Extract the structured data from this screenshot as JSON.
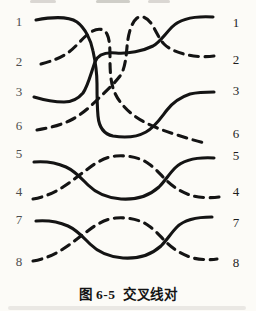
{
  "figure": {
    "caption": "图 6-5  交叉线对",
    "caption_number": "图 6-5",
    "caption_title": "交叉线对",
    "type": "wiring-diagram",
    "description_visible_content": "Eight wires drawn between identical pin columns; pairs 1/2 and 3/6 cross over each other, pairs 5/4 and 7/8 are simple twisted pairs"
  },
  "labels": {
    "left": [
      "1",
      "2",
      "3",
      "6",
      "5",
      "4",
      "7",
      "8"
    ],
    "right": [
      "1",
      "2",
      "3",
      "6",
      "5",
      "4",
      "7",
      "8"
    ]
  },
  "colors": {
    "background": "#fcfbf7",
    "line": "#141414",
    "label_left": "#4e4e4e",
    "label_right": "#1d1d1d"
  },
  "wires": [
    {
      "name": "wire-left1-to-right3",
      "from": "1",
      "to": "3",
      "style": "solid",
      "path": "M 36 20 C 52 17 68 16 77 22 C 85 28 91 40 93 51 C 95 60 97 70 97 84 C 97 95 97 105 98 116 C 99 127 103 134 113 136 C 125 138 137 137 146 132 C 155 127 160 119 167 110 C 174 101 181 97 190 94 C 199 92 207 92 214 92"
    },
    {
      "name": "wire-left3-to-right1",
      "from": "3",
      "to": "1",
      "style": "solid",
      "path": "M 34 97 C 44 100 54 102 64 102 C 72 102 78 99 83 93 C 88 86 91 73 95 62 C 98 54 106 52 116 53 C 128 54 143 51 153 46 C 160 42 165 34 172 27 C 180 19 196 16 213 17"
    },
    {
      "name": "wire-left2-to-right6",
      "from": "2",
      "to": "6",
      "style": "dashed",
      "path": "M 41 64 C 52 61 61 58 69 52 C 77 46 83 37 91 32 C 97 28 104 28 107 34 C 110 40 110 50 110 60 C 110 73 111 83 114 91 C 118 101 126 110 136 117 C 146 124 159 129 171 133 C 183 137 196 141 205 143"
    },
    {
      "name": "wire-left6-to-right2",
      "from": "6",
      "to": "2",
      "style": "dashed",
      "path": "M 37 130 C 49 128 61 125 71 120 C 81 115 90 107 98 99 C 106 91 114 84 120 76 C 125 69 126 58 127 47 C 128 35 131 23 137 18 C 143 14 150 20 154 28 C 158 35 160 40 164 44 C 170 50 179 53 188 55 C 196 57 207 57 214 56"
    },
    {
      "name": "wire-pair-5",
      "from": "5",
      "to": "5",
      "style": "solid",
      "path": "M 34 162 C 46 161 57 163 66 167 C 75 171 81 178 88 185 C 96 193 107 198 121 199 C 136 200 149 196 159 187 C 165 181 169 174 175 168 C 183 160 196 157 214 158"
    },
    {
      "name": "wire-pair-4",
      "from": "4",
      "to": "4",
      "style": "dashed",
      "path": "M 33 199 C 44 197 54 193 63 187 C 71 182 78 176 85 171 C 93 165 103 157 116 156 C 129 155 141 158 149 164 C 155 168 160 174 166 180 C 174 188 183 193 193 196 C 201 198 212 198 219 197"
    },
    {
      "name": "wire-pair-7",
      "from": "7",
      "to": "7",
      "style": "solid",
      "path": "M 36 221 C 48 220 59 222 68 226 C 77 230 83 237 90 244 C 98 252 109 257 123 258 C 138 259 151 255 161 246 C 167 240 171 233 177 227 C 185 219 198 217 212 217"
    },
    {
      "name": "wire-pair-8",
      "from": "8",
      "to": "8",
      "style": "dashed",
      "path": "M 33 261 C 44 259 54 255 63 249 C 71 244 78 238 85 233 C 93 227 103 219 116 218 C 129 217 141 220 149 226 C 155 230 160 236 166 242 C 174 250 183 255 193 258 C 201 260 211 260 217 259"
    }
  ]
}
